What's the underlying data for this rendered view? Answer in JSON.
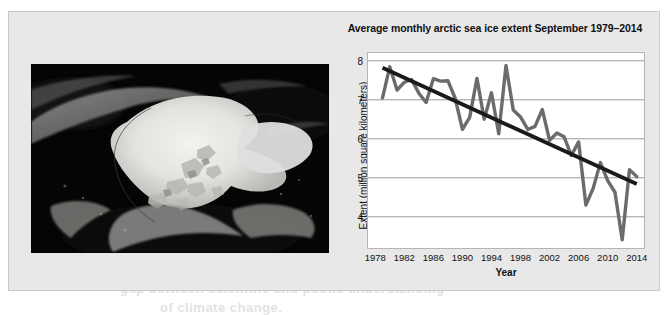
{
  "panel": {
    "photo_alt": "arctic-sea-ice-satellite-image"
  },
  "bleed_text": [
    {
      "t": "PSYCHOLOGY",
      "x": 372,
      "y": 152,
      "size": 19
    },
    {
      "t": "CLIMATE",
      "x": 372,
      "y": 176,
      "size": 19
    },
    {
      "t": "Mantle people",
      "x": 372,
      "y": 196,
      "size": 12
    },
    {
      "t": "Summarize and explain the",
      "x": 195,
      "y": 262,
      "size": 13
    },
    {
      "t": "gap between scientific and public understanding",
      "x": 120,
      "y": 281,
      "size": 13
    },
    {
      "t": "of climate change.",
      "x": 160,
      "y": 300,
      "size": 13
    },
    {
      "t": "while researching",
      "x": 92,
      "y": 245,
      "size": 13
    }
  ],
  "chart_data": {
    "type": "line",
    "title": "Average monthly arctic sea ice extent September 1979–2014",
    "xlabel": "Year",
    "ylabel": "Extent (million square kilometers)",
    "xlim": [
      1977,
      2015
    ],
    "ylim": [
      3.2,
      8.2
    ],
    "xticks": [
      1978,
      1982,
      1986,
      1990,
      1994,
      1998,
      2002,
      2006,
      2010,
      2014
    ],
    "yticks": [
      4,
      5,
      6,
      7,
      8
    ],
    "grid": "horizontal",
    "legend": "none",
    "series": [
      {
        "name": "September sea ice extent",
        "color": "#6b6b6b",
        "x": [
          1979,
          1980,
          1981,
          1982,
          1983,
          1984,
          1985,
          1986,
          1987,
          1988,
          1989,
          1990,
          1991,
          1992,
          1993,
          1994,
          1995,
          1996,
          1997,
          1998,
          1999,
          2000,
          2001,
          2002,
          2003,
          2004,
          2005,
          2006,
          2007,
          2008,
          2009,
          2010,
          2011,
          2012,
          2013,
          2014
        ],
        "values": [
          7.05,
          7.85,
          7.25,
          7.45,
          7.52,
          7.17,
          6.93,
          7.54,
          7.48,
          7.49,
          7.04,
          6.24,
          6.55,
          7.55,
          6.5,
          7.18,
          6.13,
          7.88,
          6.74,
          6.56,
          6.24,
          6.32,
          6.75,
          5.96,
          6.15,
          6.05,
          5.57,
          5.92,
          4.3,
          4.73,
          5.39,
          4.93,
          4.63,
          3.41,
          5.21,
          5.03
        ]
      },
      {
        "name": "Linear trend",
        "color": "#1a1a1a",
        "x": [
          1979,
          2014
        ],
        "values": [
          7.82,
          4.84
        ]
      }
    ]
  }
}
